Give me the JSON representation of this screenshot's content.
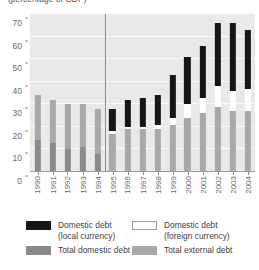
{
  "chart_data": {
    "type": "bar",
    "title": "(percentage of GDP)",
    "xlabel": "",
    "ylabel": "",
    "ylim": [
      0,
      70
    ],
    "yticks": [
      0,
      10,
      20,
      30,
      40,
      50,
      60,
      70
    ],
    "grid": true,
    "stacked": true,
    "legend_position": "bottom",
    "categories": [
      "1990",
      "1991",
      "1992",
      "1993",
      "1994",
      "1995",
      "1996",
      "1997",
      "1998",
      "1999",
      "2000",
      "2001",
      "2002",
      "2003",
      "2004"
    ],
    "series": [
      {
        "name": "Total domestic debt",
        "color": "#8a8a8a",
        "values": [
          14,
          13,
          10,
          11,
          8,
          null,
          null,
          null,
          null,
          null,
          null,
          null,
          null,
          null,
          null
        ]
      },
      {
        "name": "Total external debt",
        "color": "#a8a8a8",
        "values": [
          20,
          19,
          20,
          19,
          20,
          17,
          19,
          19,
          19,
          21,
          24,
          26,
          29,
          27,
          27
        ]
      },
      {
        "name": "Domestic debt (foreign currency)",
        "color": "#ffffff",
        "values": [
          null,
          null,
          null,
          null,
          null,
          1,
          1,
          1,
          2,
          3,
          6,
          7,
          9,
          9,
          10
        ]
      },
      {
        "name": "Domestic debt (local currency)",
        "color": "#161616",
        "values": [
          null,
          null,
          null,
          null,
          null,
          10,
          12,
          13,
          13,
          19,
          21,
          23,
          28,
          30,
          26
        ]
      }
    ],
    "totals": [
      34,
      32,
      30,
      30,
      28,
      28,
      32,
      33,
      34,
      43,
      51,
      56,
      66,
      66,
      63
    ],
    "annotations": [
      {
        "type": "vertical-divider",
        "between": [
          "1994",
          "1995"
        ]
      }
    ]
  },
  "legend": {
    "items": [
      {
        "label_line1": "Domestic debt",
        "label_line2": "(local currency)",
        "swatch": "black-swatch"
      },
      {
        "label_line1": "Domestic debt",
        "label_line2": "(foreign currency)",
        "swatch": "white-swatch"
      },
      {
        "label_line1": "Total domestic debt",
        "label_line2": "",
        "swatch": "dark-gray-swatch"
      },
      {
        "label_line1": "Total external debt",
        "label_line2": "",
        "swatch": "light-gray-swatch"
      }
    ]
  }
}
